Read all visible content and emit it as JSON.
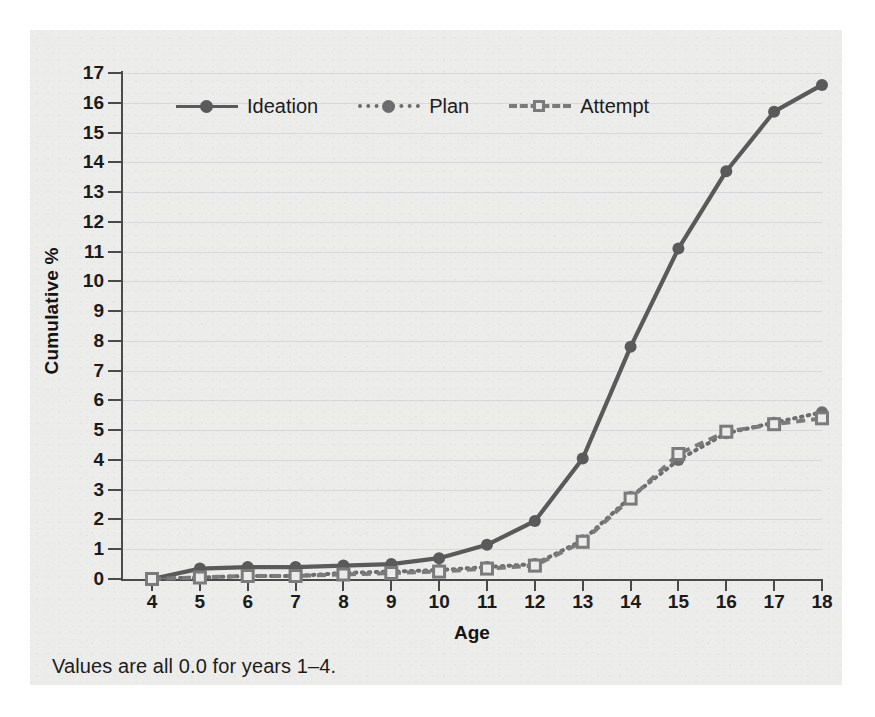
{
  "figure": {
    "footnote": "Values are all 0.0 for years 1–4.",
    "xtitle": "Age",
    "ytitle": "Cumulative %"
  },
  "legend": {
    "items": [
      {
        "label": "Ideation",
        "style": "solid-circle",
        "color": "#5a5a5a"
      },
      {
        "label": "Plan",
        "style": "dotted-circle",
        "color": "#6d6d6d"
      },
      {
        "label": "Attempt",
        "style": "dashed-open-square",
        "color": "#7b7b7b"
      }
    ]
  },
  "axes": {
    "y_ticks": [
      "17",
      "16",
      "15",
      "14",
      "13",
      "12",
      "11",
      "10",
      "9",
      "8",
      "7",
      "6",
      "5",
      "4",
      "3",
      "2",
      "1",
      "0"
    ],
    "x_ticks": [
      "4",
      "5",
      "6",
      "7",
      "8",
      "9",
      "10",
      "11",
      "12",
      "13",
      "14",
      "15",
      "16",
      "17",
      "18"
    ]
  },
  "chart_data": {
    "type": "line",
    "title": "",
    "subtitle": "",
    "xlabel": "Age",
    "ylabel": "Cumulative %",
    "xlim": [
      4,
      18
    ],
    "ylim": [
      0,
      17
    ],
    "grid": true,
    "legend_position": "top-left-inside",
    "annotations": [
      "Values are all 0.0 for years 1–4."
    ],
    "x": [
      4,
      5,
      6,
      7,
      8,
      9,
      10,
      11,
      12,
      13,
      14,
      15,
      16,
      17,
      18
    ],
    "series": [
      {
        "name": "Ideation",
        "color": "#5a5a5a",
        "linestyle": "solid",
        "marker": "filled-circle",
        "values": [
          0.0,
          0.35,
          0.4,
          0.4,
          0.45,
          0.5,
          0.7,
          1.15,
          1.95,
          4.05,
          7.8,
          11.1,
          13.7,
          15.7,
          16.6
        ]
      },
      {
        "name": "Plan",
        "color": "#6d6d6d",
        "linestyle": "dotted",
        "marker": "filled-circle",
        "values": [
          0.0,
          0.05,
          0.1,
          0.1,
          0.2,
          0.25,
          0.3,
          0.4,
          0.5,
          1.3,
          2.75,
          4.0,
          4.9,
          5.25,
          5.6
        ]
      },
      {
        "name": "Attempt",
        "color": "#7b7b7b",
        "linestyle": "dashed",
        "marker": "open-square",
        "values": [
          0.0,
          0.05,
          0.1,
          0.1,
          0.15,
          0.2,
          0.25,
          0.35,
          0.45,
          1.25,
          2.7,
          4.2,
          4.95,
          5.2,
          5.4
        ]
      }
    ]
  }
}
